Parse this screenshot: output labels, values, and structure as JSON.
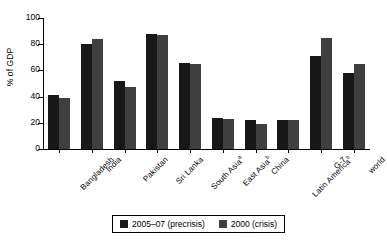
{
  "chart_data": {
    "type": "bar",
    "title": "",
    "xlabel": "",
    "ylabel": "% of GDP",
    "ylim": [
      0,
      100
    ],
    "yticks": [
      0,
      20,
      40,
      60,
      80,
      100
    ],
    "grid": false,
    "legend_position": "bottom",
    "categories": [
      "Bangladesh",
      "India",
      "Pakistan",
      "Sri Lanka",
      "South Asia",
      "East Asia",
      "China",
      "Latin America",
      "G-7",
      "world"
    ],
    "category_footnotes": [
      "",
      "",
      "",
      "",
      "a",
      "b",
      "",
      "b",
      "",
      ""
    ],
    "series": [
      {
        "name": "2005–07 (precrisis)",
        "color": "#181818",
        "values": [
          41,
          80,
          52,
          88,
          66,
          24,
          22,
          22,
          71,
          58
        ]
      },
      {
        "name": "2000 (crisis)",
        "color": "#3f3f3f",
        "values": [
          39,
          84,
          47,
          87,
          65,
          23,
          19,
          22,
          85,
          65
        ]
      }
    ]
  }
}
